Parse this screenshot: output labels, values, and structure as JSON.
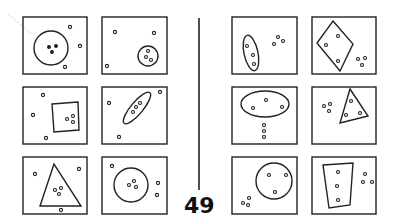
{
  "problem_number": "49",
  "colors": {
    "ink": "#222222",
    "background": "#ffffff"
  },
  "left_panels": [
    {
      "id": "L1",
      "shape": "circle",
      "cluster": "inside"
    },
    {
      "id": "L2",
      "shape": "small-ellipse",
      "cluster": "inside"
    },
    {
      "id": "L3",
      "shape": "square",
      "cluster": "inside"
    },
    {
      "id": "L4",
      "shape": "tilted-ellipse",
      "cluster": "inside"
    },
    {
      "id": "L5",
      "shape": "triangle",
      "cluster": "inside"
    },
    {
      "id": "L6",
      "shape": "circle",
      "cluster": "inside"
    }
  ],
  "right_panels": [
    {
      "id": "R1",
      "shape": "tilted-ellipse",
      "cluster": "outside"
    },
    {
      "id": "R2",
      "shape": "rhombus",
      "cluster": "outside"
    },
    {
      "id": "R3",
      "shape": "ellipse",
      "cluster": "outside"
    },
    {
      "id": "R4",
      "shape": "triangle",
      "cluster": "outside"
    },
    {
      "id": "R5",
      "shape": "circle",
      "cluster": "outside"
    },
    {
      "id": "R6",
      "shape": "trapezoid",
      "cluster": "outside"
    }
  ]
}
